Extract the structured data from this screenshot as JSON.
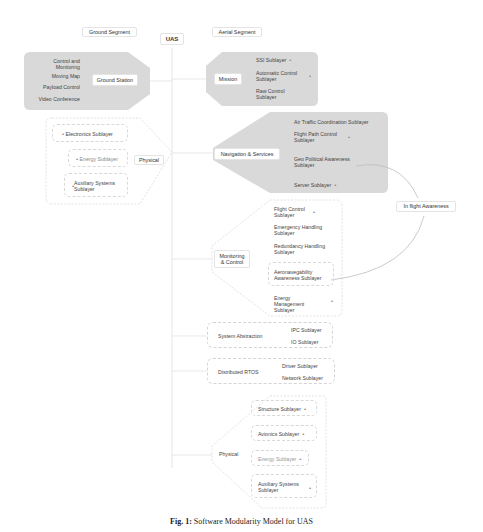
{
  "header": {
    "ground_segment": "Ground Segment",
    "root": "UAS",
    "aerial_segment": "Aerial Segment"
  },
  "ground": {
    "station": {
      "label": "Ground Station",
      "items": [
        "Control and Monitoring",
        "Moving Map",
        "Payload Control",
        "Video Conference"
      ]
    },
    "physical": {
      "label": "Physical",
      "items": [
        "Electronics Sublayer",
        "Energy Sublayer",
        "Auxiliary Systems Sublayer"
      ]
    }
  },
  "aerial": {
    "mission": {
      "label": "Mission",
      "items": [
        "SSI Sublayer",
        "Automatic Control Sublayer",
        "Raw Control Sublayer"
      ]
    },
    "navigation": {
      "label": "Navigation & Services",
      "items": [
        "Air Traffic Coordination Sublayer",
        "Flight Path Control Sublayer",
        "Geo Political Awareness Sublayer",
        "Server Sublayer"
      ]
    },
    "monitoring": {
      "label": "Monitoring & Control",
      "items": [
        "Flight Control Sublayer",
        "Emergency Handling Sublayer",
        "Redundancy Handling Sublayer",
        "Aeronavegability Awareness Sublayer",
        "Energy Management Sublayer"
      ]
    },
    "abstraction": {
      "label": "System Abstraction",
      "items": [
        "IPC Sublayer",
        "IO Sublayer"
      ]
    },
    "rtos": {
      "label": "Distributed RTOS",
      "items": [
        "Driver Sublayer",
        "Network Sublayer"
      ]
    },
    "physical": {
      "label": "Physical",
      "items": [
        "Structure Sublayer",
        "Avionics Sublayer",
        "Energy Sublayer",
        "Auxiliary Systems Sublayer"
      ]
    }
  },
  "inflight": {
    "label": "In flight Awareness"
  },
  "caption": {
    "prefix": "Fig. 1:",
    "text": "Software Modularity Model for UAS"
  }
}
